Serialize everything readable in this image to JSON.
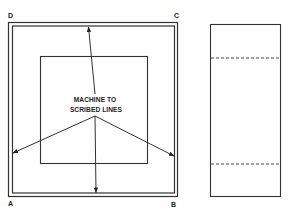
{
  "figure": {
    "corner_labels": {
      "top_left": "D",
      "top_right": "C",
      "bottom_left": "A",
      "bottom_right": "B"
    },
    "annotation": {
      "line1": "MACHINE TO",
      "line2": "SCRIBED LINES"
    },
    "colors": {
      "line": "#333333",
      "background": "#ffffff"
    }
  }
}
